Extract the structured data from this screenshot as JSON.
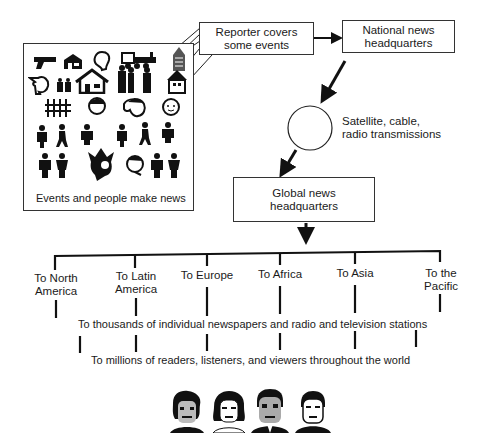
{
  "diagram": {
    "events_box": {
      "caption": "Events and people make news",
      "icons": [
        "pistol-icon",
        "barn-icon",
        "head-icon",
        "train-icon",
        "building-icon",
        "profile-head-icon",
        "family-icon",
        "house-icon",
        "people-group-icon",
        "house-small-icon",
        "dancers-icon",
        "face-icon",
        "woman-face-icon",
        "baby-face-icon",
        "person-icon",
        "walker-icon",
        "figure-icon",
        "person-icon",
        "walker-icon",
        "figure-icon",
        "couple-icon",
        "jester-icon",
        "man-face-icon",
        "couple-icon"
      ]
    },
    "reporter_box": {
      "line1": "Reporter covers",
      "line2": "some events"
    },
    "national_box": {
      "line1": "National news",
      "line2": "headquarters"
    },
    "satellite": {
      "line1": "Satellite, cable,",
      "line2": "radio transmissions"
    },
    "global_box": {
      "line1": "Global news",
      "line2": "headquarters"
    },
    "regions": [
      {
        "line1": "To North",
        "line2": "America"
      },
      {
        "line1": "To Latin",
        "line2": "America"
      },
      {
        "line1": "To Europe",
        "line2": ""
      },
      {
        "line1": "To Africa",
        "line2": ""
      },
      {
        "line1": "To Asia",
        "line2": ""
      },
      {
        "line1": "To the",
        "line2": "Pacific"
      }
    ],
    "tier2_text": "To thousands of individual newspapers and radio and television stations",
    "tier3_text": "To millions of readers, listeners, and viewers throughout the world",
    "audience_faces": [
      "woman-face-icon",
      "woman-face-icon",
      "man-face-icon",
      "man-face-icon"
    ],
    "colors": {
      "ink": "#1a1a1a",
      "background": "#ffffff"
    }
  }
}
